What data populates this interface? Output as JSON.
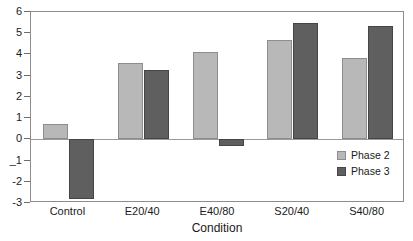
{
  "chart_data": {
    "type": "bar",
    "title": "",
    "subtitle": "",
    "xlabel": "Condition",
    "ylabel": "",
    "categories": [
      "Control",
      "E20/40",
      "E40/80",
      "S20/40",
      "S40/80"
    ],
    "series": [
      {
        "name": "Phase 2",
        "color": "#b8b8b8",
        "values": [
          0.7,
          3.6,
          4.1,
          4.7,
          3.85
        ]
      },
      {
        "name": "Phase 3",
        "color": "#5f5f5f",
        "values": [
          -2.8,
          3.25,
          -0.3,
          5.5,
          5.35
        ]
      }
    ],
    "ylim": [
      -3,
      6
    ],
    "yticks": [
      6,
      5,
      4,
      3,
      2,
      1,
      0,
      -1,
      -2,
      -3
    ],
    "ytick_labels": [
      "6",
      "5",
      "4",
      "3",
      "2",
      "1",
      "0",
      "_1",
      "-2",
      "-3"
    ],
    "grid": false,
    "zero_line": true,
    "legend_position": "inside-bottom-right"
  },
  "legend": {
    "entries": [
      {
        "label": "Phase 2",
        "color": "#b8b8b8"
      },
      {
        "label": "Phase 3",
        "color": "#5f5f5f"
      }
    ]
  },
  "axis": {
    "x_title": "Condition"
  },
  "colors": {
    "phase2": "#b8b8b8",
    "phase3": "#5f5f5f",
    "frame": "#8c8c8c",
    "zero_line": "#9a9a9a",
    "text": "#1a1a1a"
  }
}
